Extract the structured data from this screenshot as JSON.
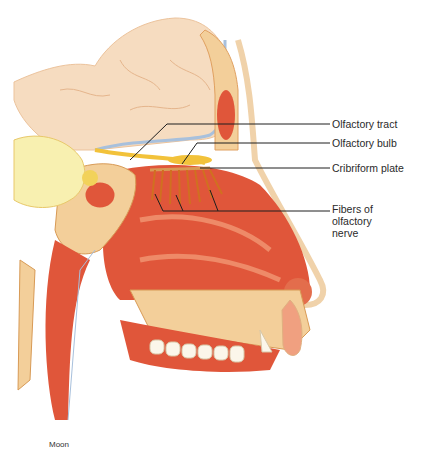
{
  "figure": {
    "labels": [
      {
        "id": "olfactory-tract",
        "text": "Olfactory tract",
        "x": 332,
        "y": 118
      },
      {
        "id": "olfactory-bulb",
        "text": "Olfactory bulb",
        "x": 332,
        "y": 137
      },
      {
        "id": "cribriform-plate",
        "text": "Cribriform plate",
        "x": 332,
        "y": 162
      },
      {
        "id": "fibers-line1",
        "text": "Fibers of",
        "x": 332,
        "y": 203
      },
      {
        "id": "fibers-line2",
        "text": "olfactory",
        "x": 332,
        "y": 215
      },
      {
        "id": "fibers-line3",
        "text": "nerve",
        "x": 332,
        "y": 227
      }
    ],
    "credit": "Moon",
    "colors": {
      "brain": "#f6dcc0",
      "brain_outline": "#e8b88e",
      "tissue_red": "#e0563a",
      "tissue_light": "#ee8a68",
      "bone": "#f3cf9a",
      "bone_spots": "#e0803a",
      "nerve_yellow": "#f2c23a",
      "meninges_blue": "#a8c0dc",
      "skin": "#f6e2c6",
      "leader": "#1e1e1e"
    }
  }
}
